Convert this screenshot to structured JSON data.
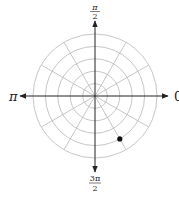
{
  "diagram": {
    "type": "polar-grid",
    "rings": 5,
    "spokes_every_radians": "π/6",
    "axis_labels": {
      "right": "0",
      "top_numerator": "π",
      "top_denominator": "2",
      "left": "π",
      "bottom_numerator": "3π",
      "bottom_denominator": "2"
    },
    "points": [
      {
        "r": 4,
        "theta_degrees": 300,
        "label": "point"
      }
    ],
    "colors": {
      "grid": "#b8b8b8",
      "axis": "#222222",
      "point": "#111111"
    }
  }
}
